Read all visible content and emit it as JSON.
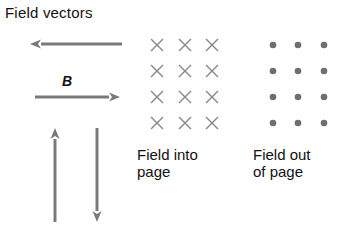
{
  "diagram": {
    "title": "Field vectors",
    "vector_label": "B",
    "arrows": [
      {
        "direction": "left",
        "x1": 122,
        "y1": 44,
        "x2": 30,
        "y2": 44
      },
      {
        "direction": "right",
        "x1": 35,
        "y1": 97,
        "x2": 120,
        "y2": 97
      },
      {
        "direction": "up",
        "x1": 55,
        "y1": 222,
        "x2": 55,
        "y2": 128
      },
      {
        "direction": "down",
        "x1": 97,
        "y1": 128,
        "x2": 97,
        "y2": 222
      }
    ],
    "into_page": {
      "symbol": "×",
      "columns": [
        157,
        185,
        212
      ],
      "rows": [
        45,
        71,
        97,
        123
      ],
      "caption_line1": "Field into",
      "caption_line2": "page"
    },
    "out_of_page": {
      "symbol": "•",
      "columns": [
        273,
        298,
        324
      ],
      "rows": [
        45,
        71,
        97,
        123
      ],
      "caption_line1": "Field out",
      "caption_line2": "of page"
    },
    "colors": {
      "arrow": "#7a7a7a",
      "cross": "#8a8a8a",
      "dot": "#6e6e6e",
      "text": "#111111"
    }
  }
}
